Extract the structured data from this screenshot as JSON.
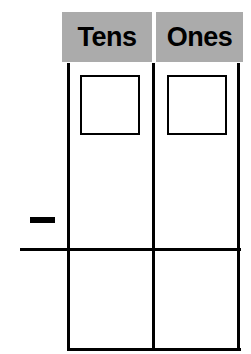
{
  "worksheet": {
    "type": "place-value-subtraction-frame",
    "columns": [
      {
        "id": "tens",
        "label": "Tens"
      },
      {
        "id": "ones",
        "label": "Ones"
      }
    ],
    "operator": {
      "name": "minus-sign",
      "glyph": "−",
      "label": ""
    },
    "entry_boxes": [
      {
        "column": "tens",
        "value": ""
      },
      {
        "column": "ones",
        "value": ""
      }
    ],
    "answer_cells": [
      {
        "column": "tens",
        "value": ""
      },
      {
        "column": "ones",
        "value": ""
      }
    ],
    "colors": {
      "header_background": "#ababab",
      "header_text": "#000000",
      "rule": "#000000",
      "page_background": "#ffffff",
      "box_border": "#000000"
    }
  }
}
